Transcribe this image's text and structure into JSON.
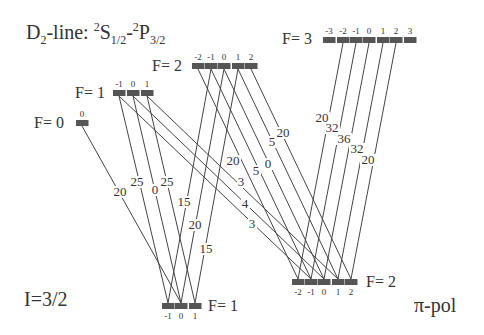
{
  "title": {
    "prefix": "D",
    "sub": "2",
    "line": "-line: ",
    "s_sup": "2",
    "s": "S",
    "s_sub": "1/2",
    "dash": "-",
    "p_sup": "2",
    "p": "P",
    "p_sub": "3/2"
  },
  "nuclear_spin": "I=3/2",
  "polarization": "π-pol",
  "upper_levels": [
    {
      "label": "F= 0",
      "y": 123,
      "m": [
        0
      ],
      "x": [
        82
      ]
    },
    {
      "label": "F= 1",
      "y": 93,
      "m": [
        -1,
        0,
        1
      ],
      "x": [
        119,
        133,
        147
      ]
    },
    {
      "label": "F= 2",
      "y": 66,
      "m": [
        -2,
        -1,
        0,
        1,
        2
      ],
      "x": [
        198,
        211,
        224,
        238,
        251
      ]
    },
    {
      "label": "F= 3",
      "y": 40,
      "m": [
        -3,
        -2,
        -1,
        0,
        1,
        2,
        3
      ],
      "x": [
        329,
        343,
        356,
        369,
        383,
        396,
        410
      ]
    }
  ],
  "lower_levels": [
    {
      "label": "F= 1",
      "y": 306,
      "m": [
        -1,
        0,
        1
      ],
      "x": [
        168,
        181,
        195
      ]
    },
    {
      "label": "F= 2",
      "y": 282,
      "m": [
        -2,
        -1,
        0,
        1,
        2
      ],
      "x": [
        298,
        311,
        324,
        338,
        351
      ]
    }
  ],
  "transitions": [
    {
      "from": "F0",
      "m": 0,
      "to": "F1",
      "coef": "20",
      "lx": 120,
      "ly": 196
    },
    {
      "from": "F1",
      "m": -1,
      "to": "F1",
      "coef": "25",
      "lx": 137,
      "ly": 186
    },
    {
      "from": "F1",
      "m": 0,
      "to": "F1",
      "coef": "0",
      "lx": 155,
      "ly": 194
    },
    {
      "from": "F1",
      "m": 1,
      "to": "F1",
      "coef": "25",
      "lx": 167,
      "ly": 186
    },
    {
      "from": "F1",
      "m": -1,
      "to": "F2",
      "coef": "3",
      "lx": 241,
      "ly": 186
    },
    {
      "from": "F1",
      "m": 0,
      "to": "F2",
      "coef": "4",
      "lx": 245,
      "ly": 208
    },
    {
      "from": "F1",
      "m": 1,
      "to": "F2",
      "coef": "3",
      "lx": 252,
      "ly": 228
    },
    {
      "from": "F2",
      "m": -1,
      "to": "F1",
      "coef": "15",
      "lx": 184,
      "ly": 206
    },
    {
      "from": "F2",
      "m": 0,
      "to": "F1",
      "coef": "20",
      "lx": 195,
      "ly": 229
    },
    {
      "from": "F2",
      "m": 1,
      "to": "F1",
      "coef": "15",
      "lx": 206,
      "ly": 253
    },
    {
      "from": "F2",
      "m": -2,
      "to": "F2",
      "coef": "20",
      "lx": 233,
      "ly": 165
    },
    {
      "from": "F2",
      "m": -1,
      "to": "F2",
      "coef": "5",
      "lx": 256,
      "ly": 175
    },
    {
      "from": "F2",
      "m": 0,
      "to": "F2",
      "coef": "0",
      "lx": 268,
      "ly": 168
    },
    {
      "from": "F2",
      "m": 1,
      "to": "F2",
      "coef": "5",
      "lx": 272,
      "ly": 146
    },
    {
      "from": "F2",
      "m": 2,
      "to": "F2",
      "coef": "20",
      "lx": 283,
      "ly": 137
    },
    {
      "from": "F3",
      "m": -2,
      "to": "F2",
      "coef": "20",
      "lx": 322,
      "ly": 122
    },
    {
      "from": "F3",
      "m": -1,
      "to": "F2",
      "coef": "32",
      "lx": 332,
      "ly": 132
    },
    {
      "from": "F3",
      "m": 0,
      "to": "F2",
      "coef": "36",
      "lx": 344,
      "ly": 143
    },
    {
      "from": "F3",
      "m": 1,
      "to": "F2",
      "coef": "32",
      "lx": 357,
      "ly": 153
    },
    {
      "from": "F3",
      "m": 2,
      "to": "F2",
      "coef": "20",
      "lx": 368,
      "ly": 164
    }
  ],
  "colors": {
    "line": "#444444",
    "bar": "#555555",
    "text": "#333333"
  }
}
